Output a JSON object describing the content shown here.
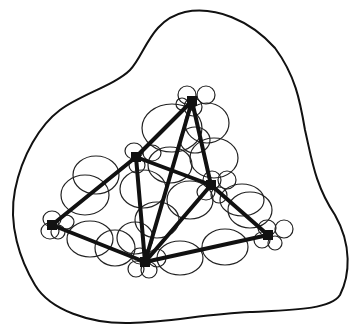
{
  "diagram": {
    "colors": {
      "stroke": "#111111",
      "background": "#ffffff"
    },
    "boundary": {
      "path": "M 60 110 C 80 95, 115 85, 130 70 C 145 55, 150 20, 185 12 C 215 6, 250 20, 275 48 C 295 75, 300 100, 305 130 C 312 160, 315 185, 335 215 C 352 245, 350 275, 340 295 C 330 310, 290 310, 250 312 C 205 314, 170 322, 130 323 C 90 324, 50 310, 35 285 C 20 260, 8 225, 15 190 C 22 155, 40 125, 60 110 Z"
    },
    "nodes": [
      {
        "id": "top",
        "x": 192,
        "y": 101
      },
      {
        "id": "upper-left",
        "x": 136,
        "y": 157
      },
      {
        "id": "right-middle",
        "x": 211,
        "y": 185
      },
      {
        "id": "left",
        "x": 52,
        "y": 225
      },
      {
        "id": "bottom",
        "x": 145,
        "y": 262
      },
      {
        "id": "right",
        "x": 268,
        "y": 235
      }
    ],
    "edges": [
      [
        "top",
        "upper-left"
      ],
      [
        "top",
        "bottom"
      ],
      [
        "top",
        "right-middle"
      ],
      [
        "upper-left",
        "left"
      ],
      [
        "upper-left",
        "bottom"
      ],
      [
        "upper-left",
        "right-middle"
      ],
      [
        "right-middle",
        "bottom"
      ],
      [
        "right-middle",
        "right"
      ],
      [
        "left",
        "bottom"
      ],
      [
        "bottom",
        "right"
      ]
    ],
    "ellipses": [
      {
        "cx": 187,
        "cy": 95,
        "rx": 9,
        "ry": 9
      },
      {
        "cx": 206,
        "cy": 95,
        "rx": 9,
        "ry": 9
      },
      {
        "cx": 193,
        "cy": 107,
        "rx": 9,
        "ry": 9
      },
      {
        "cx": 182,
        "cy": 104,
        "rx": 6,
        "ry": 6
      },
      {
        "cx": 172,
        "cy": 128,
        "rx": 30,
        "ry": 24
      },
      {
        "cx": 207,
        "cy": 123,
        "rx": 22,
        "ry": 20
      },
      {
        "cx": 195,
        "cy": 140,
        "rx": 15,
        "ry": 13
      },
      {
        "cx": 214,
        "cy": 158,
        "rx": 24,
        "ry": 20
      },
      {
        "cx": 170,
        "cy": 165,
        "rx": 22,
        "ry": 18
      },
      {
        "cx": 134,
        "cy": 151,
        "rx": 9,
        "ry": 8
      },
      {
        "cx": 152,
        "cy": 153,
        "rx": 9,
        "ry": 8
      },
      {
        "cx": 137,
        "cy": 165,
        "rx": 8,
        "ry": 8
      },
      {
        "cx": 96,
        "cy": 175,
        "rx": 23,
        "ry": 19
      },
      {
        "cx": 85,
        "cy": 195,
        "rx": 24,
        "ry": 20
      },
      {
        "cx": 143,
        "cy": 189,
        "rx": 23,
        "ry": 19
      },
      {
        "cx": 190,
        "cy": 200,
        "rx": 23,
        "ry": 19
      },
      {
        "cx": 212,
        "cy": 180,
        "rx": 9,
        "ry": 9
      },
      {
        "cx": 227,
        "cy": 180,
        "rx": 9,
        "ry": 9
      },
      {
        "cx": 206,
        "cy": 192,
        "rx": 9,
        "ry": 8
      },
      {
        "cx": 219,
        "cy": 195,
        "rx": 8,
        "ry": 8
      },
      {
        "cx": 242,
        "cy": 200,
        "rx": 22,
        "ry": 16
      },
      {
        "cx": 250,
        "cy": 210,
        "rx": 22,
        "ry": 18
      },
      {
        "cx": 157,
        "cy": 220,
        "rx": 22,
        "ry": 18
      },
      {
        "cx": 52,
        "cy": 219,
        "rx": 9,
        "ry": 8
      },
      {
        "cx": 66,
        "cy": 222,
        "rx": 8,
        "ry": 7
      },
      {
        "cx": 50,
        "cy": 231,
        "rx": 9,
        "ry": 8
      },
      {
        "cx": 58,
        "cy": 232,
        "rx": 7,
        "ry": 7
      },
      {
        "cx": 90,
        "cy": 239,
        "rx": 23,
        "ry": 18
      },
      {
        "cx": 115,
        "cy": 248,
        "rx": 20,
        "ry": 18
      },
      {
        "cx": 135,
        "cy": 238,
        "rx": 18,
        "ry": 16
      },
      {
        "cx": 180,
        "cy": 258,
        "rx": 23,
        "ry": 17
      },
      {
        "cx": 225,
        "cy": 247,
        "rx": 23,
        "ry": 18
      },
      {
        "cx": 140,
        "cy": 256,
        "rx": 9,
        "ry": 8
      },
      {
        "cx": 157,
        "cy": 258,
        "rx": 9,
        "ry": 9
      },
      {
        "cx": 136,
        "cy": 269,
        "rx": 8,
        "ry": 8
      },
      {
        "cx": 149,
        "cy": 270,
        "rx": 8,
        "ry": 8
      },
      {
        "cx": 267,
        "cy": 228,
        "rx": 9,
        "ry": 8
      },
      {
        "cx": 284,
        "cy": 229,
        "rx": 9,
        "ry": 9
      },
      {
        "cx": 262,
        "cy": 240,
        "rx": 8,
        "ry": 8
      },
      {
        "cx": 275,
        "cy": 243,
        "rx": 7,
        "ry": 7
      }
    ]
  }
}
